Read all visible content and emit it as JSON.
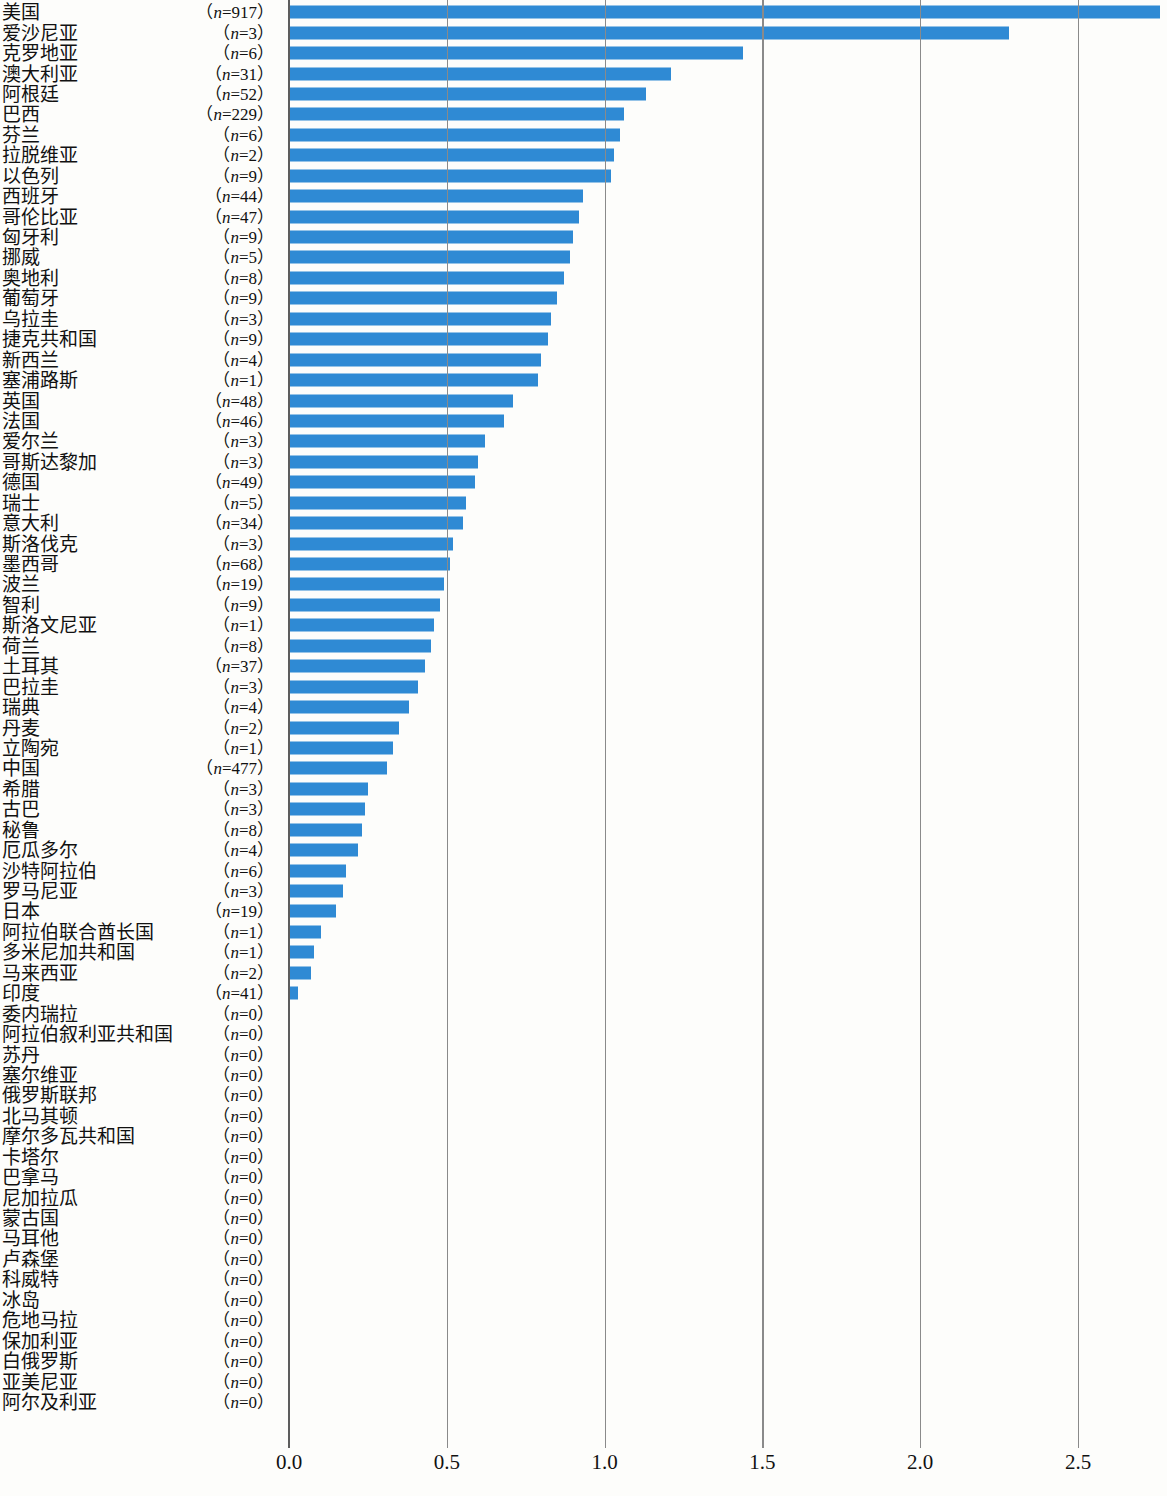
{
  "chart_data": {
    "type": "bar",
    "orientation": "horizontal",
    "title": "",
    "subtitle": "",
    "xlabel": "",
    "ylabel": "",
    "xlim": [
      0.0,
      2.78
    ],
    "xticks": [
      0.0,
      0.5,
      1.0,
      1.5,
      2.0,
      2.5
    ],
    "xticklabels": [
      "0.0",
      "0.5",
      "1.0",
      "1.5",
      "2.0",
      "2.5"
    ],
    "grid": true,
    "legend": null,
    "bar_color": "#2f8ad4",
    "axis_color": "#5d5d5d",
    "sample_size_prefix": "（",
    "sample_size_suffix": "）",
    "sample_size_var": "n",
    "categories": [
      "美国",
      "爱沙尼亚",
      "克罗地亚",
      "澳大利亚",
      "阿根廷",
      "巴西",
      "芬兰",
      "拉脱维亚",
      "以色列",
      "西班牙",
      "哥伦比亚",
      "匈牙利",
      "挪威",
      "奥地利",
      "葡萄牙",
      "乌拉圭",
      "捷克共和国",
      "新西兰",
      "塞浦路斯",
      "英国",
      "法国",
      "爱尔兰",
      "哥斯达黎加",
      "德国",
      "瑞士",
      "意大利",
      "斯洛伐克",
      "墨西哥",
      "波兰",
      "智利",
      "斯洛文尼亚",
      "荷兰",
      "土耳其",
      "巴拉圭",
      "瑞典",
      "丹麦",
      "立陶宛",
      "中国",
      "希腊",
      "古巴",
      "秘鲁",
      "厄瓜多尔",
      "沙特阿拉伯",
      "罗马尼亚",
      "日本",
      "阿拉伯联合酋长国",
      "多米尼加共和国",
      "马来西亚",
      "印度",
      "委内瑞拉",
      "阿拉伯叙利亚共和国",
      "苏丹",
      "塞尔维亚",
      "俄罗斯联邦",
      "北马其顿",
      "摩尔多瓦共和国",
      "卡塔尔",
      "巴拿马",
      "尼加拉瓜",
      "蒙古国",
      "马耳他",
      "卢森堡",
      "科威特",
      "冰岛",
      "危地马拉",
      "保加利亚",
      "白俄罗斯",
      "亚美尼亚",
      "阿尔及利亚"
    ],
    "sample_sizes": [
      917,
      3,
      6,
      31,
      52,
      229,
      6,
      2,
      9,
      44,
      47,
      9,
      5,
      8,
      9,
      3,
      9,
      4,
      1,
      48,
      46,
      3,
      3,
      49,
      5,
      34,
      3,
      68,
      19,
      9,
      1,
      8,
      37,
      3,
      4,
      2,
      1,
      477,
      3,
      3,
      8,
      4,
      6,
      3,
      19,
      1,
      1,
      2,
      41,
      0,
      0,
      0,
      0,
      0,
      0,
      0,
      0,
      0,
      0,
      0,
      0,
      0,
      0,
      0,
      0,
      0,
      0,
      0,
      0
    ],
    "values": [
      2.76,
      2.28,
      1.44,
      1.21,
      1.13,
      1.06,
      1.05,
      1.03,
      1.02,
      0.93,
      0.92,
      0.9,
      0.89,
      0.87,
      0.85,
      0.83,
      0.82,
      0.8,
      0.79,
      0.71,
      0.68,
      0.62,
      0.6,
      0.59,
      0.56,
      0.55,
      0.52,
      0.51,
      0.49,
      0.48,
      0.46,
      0.45,
      0.43,
      0.41,
      0.38,
      0.35,
      0.33,
      0.31,
      0.25,
      0.24,
      0.23,
      0.22,
      0.18,
      0.17,
      0.15,
      0.1,
      0.08,
      0.07,
      0.03,
      0.0,
      0.0,
      0.0,
      0.0,
      0.0,
      0.0,
      0.0,
      0.0,
      0.0,
      0.0,
      0.0,
      0.0,
      0.0,
      0.0,
      0.0,
      0.0,
      0.0,
      0.0,
      0.0,
      0.0
    ]
  }
}
